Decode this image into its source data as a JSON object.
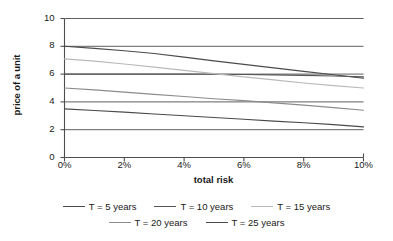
{
  "chart_data": {
    "type": "line",
    "title": "",
    "xlabel": "total risk",
    "ylabel": "price of a unit",
    "xlim": [
      0,
      10
    ],
    "ylim": [
      0,
      10
    ],
    "x_tick_labels": [
      "0%",
      "2%",
      "4%",
      "6%",
      "8%",
      "10%"
    ],
    "x_ticks": [
      0,
      2,
      4,
      6,
      8,
      10
    ],
    "y_tick_labels": [
      "0",
      "2",
      "4",
      "6",
      "8",
      "10"
    ],
    "y_ticks": [
      0,
      2,
      4,
      6,
      8,
      10
    ],
    "grid": "horizontal",
    "legend_position": "bottom",
    "x": [
      0,
      1,
      2,
      3,
      4,
      5,
      6,
      7,
      8,
      9,
      10
    ],
    "series": [
      {
        "name": "T = 5 years",
        "color": "#4a4a4a",
        "values": [
          8.0,
          7.85,
          7.68,
          7.48,
          7.22,
          6.95,
          6.7,
          6.45,
          6.2,
          5.95,
          5.7
        ]
      },
      {
        "name": "T = 10 years",
        "color": "#555555",
        "values": [
          6.0,
          6.0,
          6.0,
          6.0,
          6.0,
          5.99,
          5.97,
          5.94,
          5.91,
          5.86,
          5.8
        ]
      },
      {
        "name": "T = 15 years",
        "color": "#b9b9b9",
        "values": [
          7.1,
          6.93,
          6.73,
          6.5,
          6.27,
          6.03,
          5.8,
          5.58,
          5.36,
          5.17,
          5.0
        ]
      },
      {
        "name": "T = 20 years",
        "color": "#8c8c8c",
        "values": [
          5.0,
          4.86,
          4.7,
          4.54,
          4.39,
          4.23,
          4.09,
          3.93,
          3.77,
          3.59,
          3.4
        ]
      },
      {
        "name": "T = 25 years",
        "color": "#4a4a4a",
        "values": [
          3.5,
          3.38,
          3.26,
          3.13,
          3.0,
          2.88,
          2.75,
          2.62,
          2.5,
          2.36,
          2.2
        ]
      }
    ]
  },
  "legend": {
    "rows": [
      [
        "T = 5 years",
        "T = 10 years",
        "T = 15 years"
      ],
      [
        "T = 20 years",
        "T = 25 years"
      ]
    ]
  },
  "colors": {
    "axis": "#4d4d4d",
    "grid": "#4d4d4d",
    "text": "#1a1a1a",
    "background": "#ffffff"
  }
}
